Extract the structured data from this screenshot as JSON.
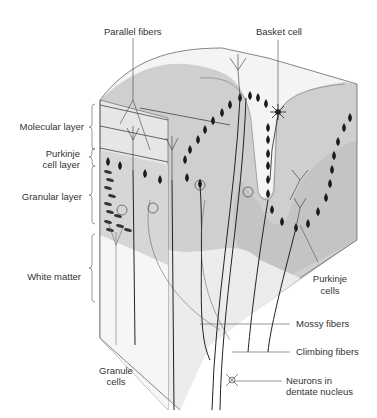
{
  "figure": {
    "colors": {
      "shade_dark": "#bdbdbd",
      "shade_light": "#e2e2e2",
      "line": "#333333",
      "cell": "#1a1a1a"
    }
  },
  "labels": {
    "parallel_fibers": "Parallel fibers",
    "basket_cell": "Basket cell",
    "molecular_layer": "Molecular layer",
    "purkinje_cell_layer_1": "Purkinje",
    "purkinje_cell_layer_2": "cell layer",
    "granular_layer": "Granular layer",
    "white_matter": "White matter",
    "granule_cells_1": "Granule",
    "granule_cells_2": "cells",
    "purkinje_cells_1": "Purkinje",
    "purkinje_cells_2": "cells",
    "mossy_fibers": "Mossy fibers",
    "climbing_fibers": "Climbing fibers",
    "neurons_dentate_1": "Neurons in",
    "neurons_dentate_2": "dentate nucleus"
  }
}
